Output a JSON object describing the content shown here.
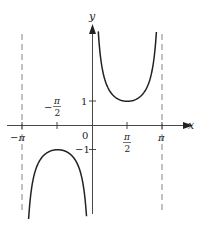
{
  "chart_data": {
    "type": "line",
    "title": "",
    "function": "y = csc x",
    "xlabel": "x",
    "ylabel": "y",
    "x_ticks": [
      {
        "value": -3.14159,
        "label": "−π"
      },
      {
        "value": -1.5708,
        "label": "−π/2",
        "num": "π",
        "den": "2",
        "neg": true
      },
      {
        "value": 0,
        "label": "0"
      },
      {
        "value": 1.5708,
        "label": "π/2",
        "num": "π",
        "den": "2",
        "neg": false
      },
      {
        "value": 3.14159,
        "label": "π"
      }
    ],
    "y_ticks": [
      {
        "value": 1,
        "label": "1"
      },
      {
        "value": -1,
        "label": "−1"
      }
    ],
    "asymptotes_x": [
      -3.14159,
      3.14159
    ],
    "xlim": [
      -3.14159,
      3.14159
    ],
    "ylim": [
      -3.7,
      3.8
    ],
    "series": [
      {
        "name": "upper branch",
        "domain": [
          0.26,
          2.88
        ],
        "min_point": [
          1.5708,
          1
        ]
      },
      {
        "name": "lower branch",
        "domain": [
          -2.88,
          -0.27
        ],
        "max_point": [
          -1.5708,
          -1
        ]
      }
    ],
    "grid": false,
    "legend": "none"
  },
  "labels": {
    "x_axis": "x",
    "y_axis": "y",
    "origin": "0",
    "neg_pi": "−π",
    "pi": "π",
    "pi_sym": "π",
    "two": "2",
    "minus": "−",
    "one": "1",
    "neg_one": "−1"
  }
}
